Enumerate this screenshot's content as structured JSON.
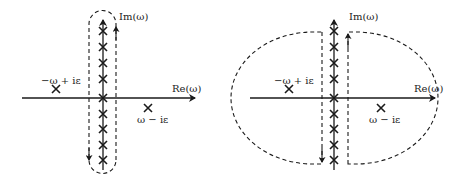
{
  "panels": [
    {
      "id": "left",
      "contour": "closed-loop around imaginary axis",
      "labels": {
        "im_axis": "Im(ω)",
        "re_axis": "Re(ω)",
        "pole_upper_left": "−ω + iε",
        "pole_lower_right": "ω − iε"
      }
    },
    {
      "id": "right",
      "contour": "deformed into large arcs enclosing half-planes",
      "labels": {
        "im_axis": "Im(ω)",
        "re_axis": "Re(ω)",
        "pole_upper_left": "−ω + iε",
        "pole_lower_right": "ω − iε"
      }
    }
  ],
  "colors": {
    "stroke": "#1a1a1a",
    "background": "#ffffff"
  }
}
